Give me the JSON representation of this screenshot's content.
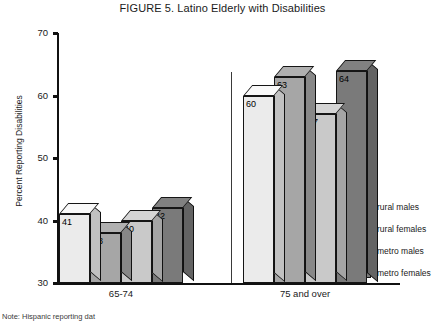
{
  "chart_data": {
    "type": "bar",
    "title": "FIGURE 5. Latino Elderly with Disabilities",
    "xlabel": "",
    "ylabel": "Percent Reporting Disabilities",
    "ylim": [
      30,
      70
    ],
    "yticks": [
      30,
      40,
      50,
      60,
      70
    ],
    "grid": false,
    "legend_position": "right",
    "style": "3d-column",
    "categories": [
      "65-74",
      "75 and over"
    ],
    "series": [
      {
        "name": "rural males",
        "values": [
          41,
          60
        ],
        "color": "#ebebeb"
      },
      {
        "name": "rural females",
        "values": [
          38,
          63
        ],
        "color": "#a6a6a6"
      },
      {
        "name": "metro males",
        "values": [
          40,
          57
        ],
        "color": "#c9c9c9"
      },
      {
        "name": "metro females",
        "values": [
          42,
          64
        ],
        "color": "#7a7a7a"
      }
    ]
  },
  "footnote": "Note: Hispanic reporting dat"
}
